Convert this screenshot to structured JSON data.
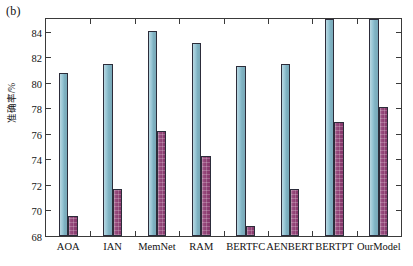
{
  "panel": {
    "tag": "(b)"
  },
  "chart_data": {
    "type": "bar",
    "title": "",
    "subtitle": "",
    "xlabel": "",
    "ylabel": "准确率/%",
    "categories": [
      "AOA",
      "IAN",
      "MemNet",
      "RAM",
      "BERTFC",
      "AENBERT",
      "BERTPT",
      "OurModel"
    ],
    "series": [
      {
        "name": "series-a",
        "color": "#86bccd",
        "values": [
          80.8,
          81.5,
          84.1,
          83.1,
          81.3,
          81.5,
          85.1,
          85.2
        ]
      },
      {
        "name": "series-b",
        "color": "#8e3c72",
        "values": [
          69.6,
          71.7,
          76.2,
          74.3,
          68.8,
          71.7,
          76.9,
          78.1
        ]
      }
    ],
    "ylim": [
      68,
      85
    ],
    "yticks": [
      68,
      70,
      72,
      74,
      76,
      78,
      80,
      82,
      84
    ],
    "ytick_labels": [
      "68",
      "70",
      "72",
      "74",
      "76",
      "78",
      "80",
      "82",
      "84"
    ],
    "grid": false,
    "legend": "none",
    "axis_style": "box-inward-ticks"
  }
}
